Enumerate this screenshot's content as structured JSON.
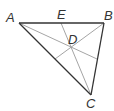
{
  "diagram": {
    "type": "triangle-with-cevians",
    "labels": {
      "A": "A",
      "B": "B",
      "C": "C",
      "D": "D",
      "E": "E"
    },
    "colors": {
      "side": "#333333",
      "cevian": "#999999",
      "label": "#333333"
    }
  }
}
